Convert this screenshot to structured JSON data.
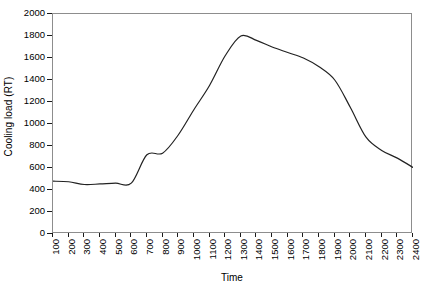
{
  "chart_data": {
    "type": "line",
    "title": "",
    "xlabel": "Time",
    "ylabel": "Cooling load (RT)",
    "xlim": [
      100,
      2400
    ],
    "ylim": [
      0,
      2000
    ],
    "grid": false,
    "legend": null,
    "line_color": "#222222",
    "frame_color": "#8d8d8d",
    "y_ticks": [
      0,
      200,
      400,
      600,
      800,
      1000,
      1200,
      1400,
      1600,
      1800,
      2000
    ],
    "y_tick_labels": [
      "0",
      "200",
      "400",
      "600",
      "800",
      "1000",
      "1200",
      "1400",
      "1600",
      "1800",
      "2000"
    ],
    "x_ticks": [
      100,
      200,
      300,
      400,
      500,
      600,
      700,
      800,
      900,
      1000,
      1100,
      1200,
      1300,
      1400,
      1500,
      1600,
      1700,
      1800,
      1900,
      2000,
      2100,
      2200,
      2300,
      2400
    ],
    "x_tick_labels": [
      "100",
      "200",
      "300",
      "400",
      "500",
      "600",
      "700",
      "800",
      "900",
      "1000",
      "1100",
      "1200",
      "1300",
      "1400",
      "1500",
      "1600",
      "1700",
      "1800",
      "1900",
      "2000",
      "2100",
      "2200",
      "2300",
      "2400"
    ],
    "categories": [
      100,
      200,
      300,
      400,
      500,
      600,
      700,
      800,
      900,
      1000,
      1100,
      1200,
      1300,
      1400,
      1500,
      1600,
      1700,
      1800,
      1900,
      2000,
      2100,
      2200,
      2300,
      2400
    ],
    "values": [
      480,
      475,
      450,
      455,
      462,
      462,
      720,
      735,
      900,
      1130,
      1350,
      1620,
      1800,
      1760,
      1700,
      1650,
      1600,
      1520,
      1400,
      1150,
      880,
      760,
      690,
      605
    ],
    "series": [
      {
        "name": "Cooling load",
        "values": [
          480,
          475,
          450,
          455,
          462,
          462,
          720,
          735,
          900,
          1130,
          1350,
          1620,
          1800,
          1760,
          1700,
          1650,
          1600,
          1520,
          1400,
          1150,
          880,
          760,
          690,
          605
        ]
      }
    ]
  }
}
